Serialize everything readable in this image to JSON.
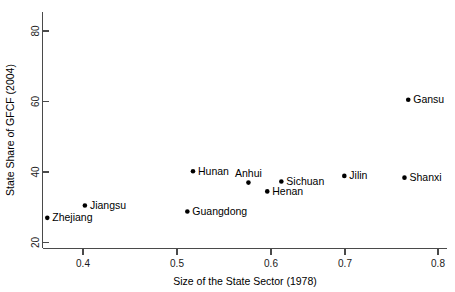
{
  "chart_data": {
    "type": "scatter",
    "title": "",
    "xlabel": "Size of the State Sector (1978)",
    "ylabel": "State Share of GFCF (2004)",
    "xlim": [
      0.355,
      0.805
    ],
    "ylim": [
      19.5,
      80.5
    ],
    "xticks": [
      0.4,
      0.5,
      0.6,
      0.7,
      0.8
    ],
    "xticklabels": [
      "0.4",
      "0.5",
      "0.6",
      "0.7",
      "0.8"
    ],
    "yticks": [
      20,
      40,
      60,
      80
    ],
    "yticklabels": [
      "20",
      "40",
      "60",
      "80"
    ],
    "grid": false,
    "legend": false,
    "marker": "filled-circle",
    "marker_color": "#000000",
    "points": [
      {
        "label": "Zhejiang",
        "x": 0.362,
        "y": 27.0,
        "label_pos": "right"
      },
      {
        "label": "Jiangsu",
        "x": 0.402,
        "y": 30.5,
        "label_pos": "right"
      },
      {
        "label": "Guangdong",
        "x": 0.511,
        "y": 28.8,
        "label_pos": "right"
      },
      {
        "label": "Hunan",
        "x": 0.517,
        "y": 40.2,
        "label_pos": "right"
      },
      {
        "label": "Anhui",
        "x": 0.576,
        "y": 37.0,
        "label_pos": "above"
      },
      {
        "label": "Henan",
        "x": 0.596,
        "y": 34.5,
        "label_pos": "right"
      },
      {
        "label": "Sichuan",
        "x": 0.611,
        "y": 37.3,
        "label_pos": "right"
      },
      {
        "label": "Jilin",
        "x": 0.678,
        "y": 38.9,
        "label_pos": "right"
      },
      {
        "label": "Shanxi",
        "x": 0.742,
        "y": 38.4,
        "label_pos": "right"
      },
      {
        "label": "Gansu",
        "x": 0.746,
        "y": 60.5,
        "label_pos": "right"
      }
    ]
  },
  "axes": {
    "x_title": "Size of the State Sector (1978)",
    "y_title": "State Share of GFCF (2004)"
  }
}
